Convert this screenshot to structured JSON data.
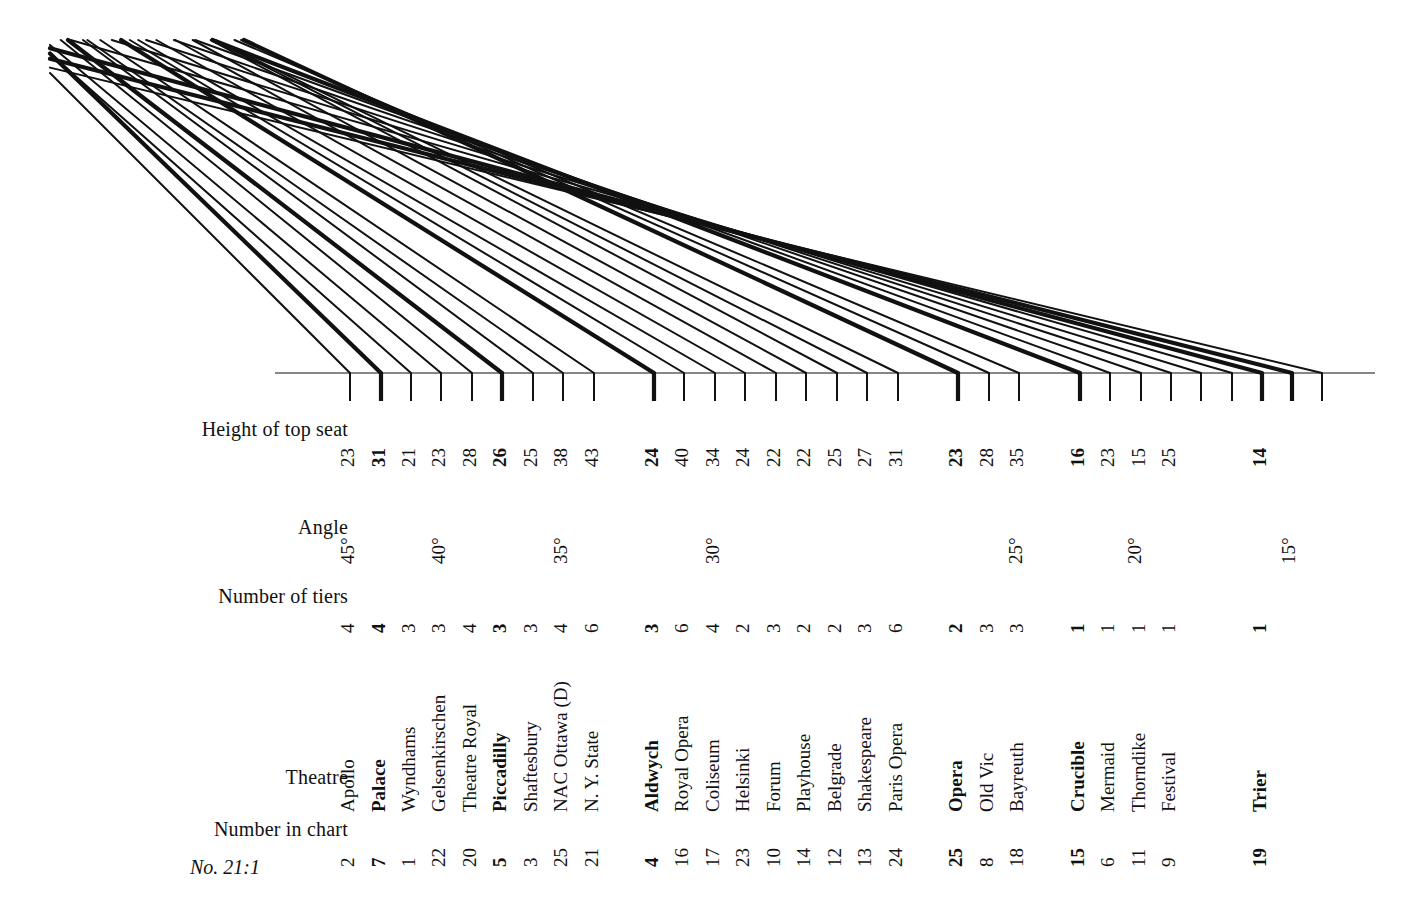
{
  "figure": {
    "number_label": "No. 21:1",
    "row_labels": {
      "height": "Height of top seat",
      "angle": "Angle",
      "tiers": "Number of tiers",
      "theatre": "Theatre",
      "chart_number": "Number in chart"
    }
  },
  "chart_data": {
    "type": "line",
    "title": "No. 21:1",
    "xlabel": "Theatre",
    "ylabel": "Height of top seat",
    "grid": false,
    "legend": null,
    "axis_angle_ticks": [
      {
        "label": "45°",
        "value": 45,
        "x": 350
      },
      {
        "label": "40°",
        "value": 40,
        "x": 441
      },
      {
        "label": "35°",
        "value": 35,
        "x": 563
      },
      {
        "label": "30°",
        "value": 30,
        "x": 715
      },
      {
        "label": "25°",
        "value": 25,
        "x": 1018
      },
      {
        "label": "20°",
        "value": 20,
        "x": 1137
      },
      {
        "label": "15°",
        "value": 15,
        "x": 1291
      }
    ],
    "categories": [
      "Apollo",
      "Palace",
      "Wyndhams",
      "Gelsenkirschen",
      "Theatre Royal",
      "Piccadilly",
      "Shaftesbury",
      "NAC Ottawa (D)",
      "N. Y. State",
      "Aldwych",
      "Royal Opera",
      "Coliseum",
      "Helsinki",
      "Forum",
      "Playhouse",
      "Belgrade",
      "Shakespeare",
      "Paris Opera",
      "Opera",
      "Old Vic",
      "Bayreuth",
      "Crucible",
      "Mermaid",
      "Thorndike",
      "Festival",
      "Trier"
    ],
    "values": [
      23,
      31,
      21,
      23,
      28,
      26,
      25,
      38,
      43,
      24,
      40,
      34,
      24,
      22,
      22,
      25,
      27,
      31,
      23,
      28,
      35,
      16,
      23,
      15,
      25,
      14
    ],
    "ylim": [
      0,
      45
    ],
    "columns": [
      {
        "theatre": "Apollo",
        "height": 23,
        "tiers": 4,
        "chart_number": 2,
        "x": 350,
        "angle": 45.0,
        "bold": false
      },
      {
        "theatre": "Palace",
        "height": 31,
        "tiers": 4,
        "chart_number": 7,
        "x": 381,
        "angle": 44.0,
        "bold": true
      },
      {
        "theatre": "Wyndhams",
        "height": 21,
        "tiers": 3,
        "chart_number": 1,
        "x": 411,
        "angle": 41.5,
        "bold": false
      },
      {
        "theatre": "Gelsenkirschen",
        "height": 23,
        "tiers": 3,
        "chart_number": 22,
        "x": 441,
        "angle": 40.0,
        "bold": false
      },
      {
        "theatre": "Theatre Royal",
        "height": 28,
        "tiers": 4,
        "chart_number": 20,
        "x": 472,
        "angle": 39.0,
        "bold": false
      },
      {
        "theatre": "Piccadilly",
        "height": 26,
        "tiers": 3,
        "chart_number": 5,
        "x": 502,
        "angle": 37.5,
        "bold": true
      },
      {
        "theatre": "Shaftesbury",
        "height": 25,
        "tiers": 3,
        "chart_number": 3,
        "x": 533,
        "angle": 36.5,
        "bold": false
      },
      {
        "theatre": "NAC Ottawa (D)",
        "height": 38,
        "tiers": 4,
        "chart_number": 25,
        "x": 563,
        "angle": 35.0,
        "bold": false
      },
      {
        "theatre": "N. Y. State",
        "height": 43,
        "tiers": 6,
        "chart_number": 21,
        "x": 594,
        "angle": 34.0,
        "bold": false
      },
      {
        "theatre": "Aldwych",
        "height": 24,
        "tiers": 3,
        "chart_number": 4,
        "x": 654,
        "angle": 32.0,
        "bold": true
      },
      {
        "theatre": "Royal Opera",
        "height": 40,
        "tiers": 6,
        "chart_number": 16,
        "x": 684,
        "angle": 31.0,
        "bold": false
      },
      {
        "theatre": "Coliseum",
        "height": 34,
        "tiers": 4,
        "chart_number": 17,
        "x": 715,
        "angle": 30.0,
        "bold": false
      },
      {
        "theatre": "Helsinki",
        "height": 24,
        "tiers": 2,
        "chart_number": 23,
        "x": 745,
        "angle": 29.5,
        "bold": false
      },
      {
        "theatre": "Forum",
        "height": 22,
        "tiers": 3,
        "chart_number": 10,
        "x": 776,
        "angle": 29.0,
        "bold": false
      },
      {
        "theatre": "Playhouse",
        "height": 22,
        "tiers": 2,
        "chart_number": 14,
        "x": 806,
        "angle": 28.5,
        "bold": false
      },
      {
        "theatre": "Belgrade",
        "height": 25,
        "tiers": 2,
        "chart_number": 12,
        "x": 837,
        "angle": 28.0,
        "bold": false
      },
      {
        "theatre": "Shakespeare",
        "height": 27,
        "tiers": 3,
        "chart_number": 13,
        "x": 867,
        "angle": 27.0,
        "bold": false
      },
      {
        "theatre": "Paris Opera",
        "height": 31,
        "tiers": 6,
        "chart_number": 24,
        "x": 898,
        "angle": 26.0,
        "bold": false
      },
      {
        "theatre": "Opera",
        "height": 23,
        "tiers": 2,
        "chart_number": 25,
        "x": 958,
        "angle": 25.0,
        "bold": true
      },
      {
        "theatre": "Old Vic",
        "height": 28,
        "tiers": 3,
        "chart_number": 8,
        "x": 989,
        "angle": 24.0,
        "bold": false
      },
      {
        "theatre": "Bayreuth",
        "height": 35,
        "tiers": 3,
        "chart_number": 18,
        "x": 1019,
        "angle": 23.0,
        "bold": false
      },
      {
        "theatre": "Crucible",
        "height": 16,
        "tiers": 1,
        "chart_number": 15,
        "x": 1080,
        "angle": 21.0,
        "bold": true
      },
      {
        "theatre": "Mermaid",
        "height": 23,
        "tiers": 1,
        "chart_number": 6,
        "x": 1110,
        "angle": 20.0,
        "bold": false
      },
      {
        "theatre": "Thorndike",
        "height": 15,
        "tiers": 1,
        "chart_number": 11,
        "x": 1141,
        "angle": 19.0,
        "bold": false
      },
      {
        "theatre": "Festival",
        "height": 25,
        "tiers": 1,
        "chart_number": 9,
        "x": 1171,
        "angle": 18.0,
        "bold": false
      },
      {
        "theatre": "Trier",
        "height": 14,
        "tiers": 1,
        "chart_number": 19,
        "x": 1262,
        "angle": 15.0,
        "bold": true
      }
    ],
    "extra_sightlines": [
      {
        "x": 1201,
        "angle": 17.0,
        "bold": false
      },
      {
        "x": 1232,
        "angle": 16.0,
        "bold": false
      },
      {
        "x": 1292,
        "angle": 14.2,
        "bold": true
      },
      {
        "x": 1322,
        "angle": 13.5,
        "bold": false
      }
    ]
  },
  "geometry": {
    "baseline_y": 373,
    "baseline_x1": 275,
    "baseline_x2": 1375,
    "tick_drop": 28,
    "line_color": "#111111"
  }
}
